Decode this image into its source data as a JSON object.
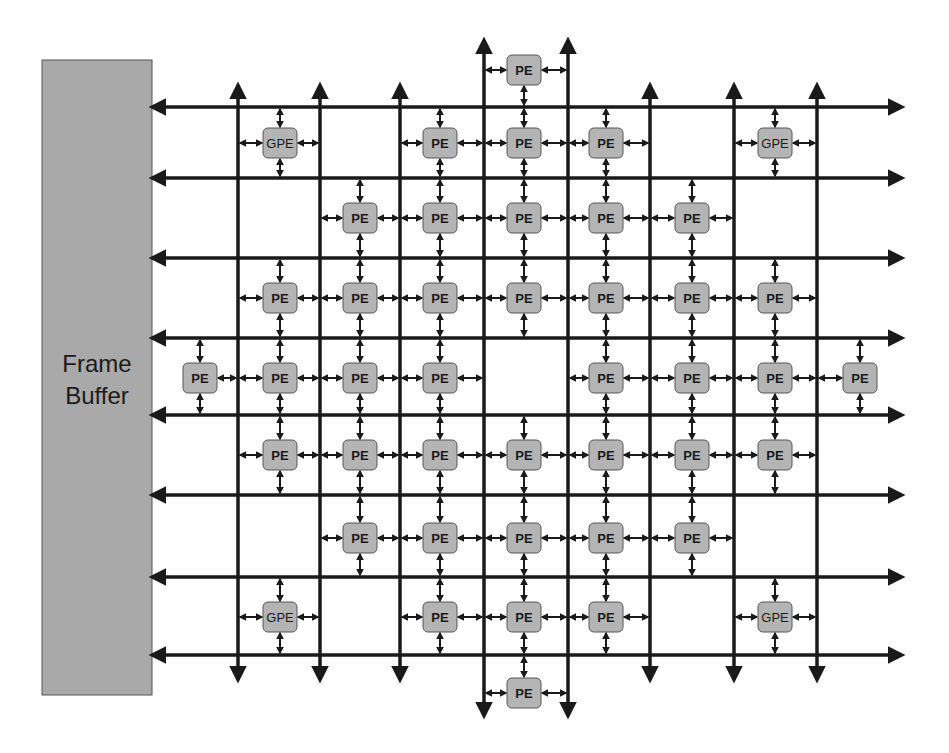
{
  "diagram": {
    "frame_buffer": {
      "label_line1": "Frame",
      "label_line2": "Buffer",
      "x": 42,
      "y": 60,
      "width": 110,
      "height": 635,
      "fill": "#a9a9a9"
    },
    "colors": {
      "line": "#1a1a1a",
      "node_fill": "#b4b4b4",
      "node_stroke": "#555555",
      "background": "#ffffff"
    },
    "horizontal_buses": [
      107,
      178,
      258,
      338,
      415,
      495,
      577,
      655
    ],
    "bus_x_start": 152,
    "bus_x_end": 902,
    "vertical_buses": [
      {
        "x": 238,
        "y1": 85,
        "y2": 680
      },
      {
        "x": 320,
        "y1": 85,
        "y2": 680
      },
      {
        "x": 400,
        "y1": 85,
        "y2": 680
      },
      {
        "x": 484,
        "y1": 40,
        "y2": 716
      },
      {
        "x": 568,
        "y1": 40,
        "y2": 716
      },
      {
        "x": 650,
        "y1": 85,
        "y2": 680
      },
      {
        "x": 734,
        "y1": 85,
        "y2": 680
      },
      {
        "x": 817,
        "y1": 85,
        "y2": 680
      }
    ],
    "nodes": [
      {
        "label": "PE",
        "x": 524,
        "y": 70,
        "up": null,
        "down": 107,
        "left": 484,
        "right": 568
      },
      {
        "label": "GPE",
        "x": 280,
        "y": 143,
        "up": 107,
        "down": 178,
        "left": 238,
        "right": 320
      },
      {
        "label": "PE",
        "x": 440,
        "y": 143,
        "up": 107,
        "down": 178,
        "left": 400,
        "right": 484
      },
      {
        "label": "PE",
        "x": 524,
        "y": 143,
        "up": 107,
        "down": 178,
        "left": 484,
        "right": 568
      },
      {
        "label": "PE",
        "x": 606,
        "y": 143,
        "up": 107,
        "down": 178,
        "left": 568,
        "right": 650
      },
      {
        "label": "GPE",
        "x": 775,
        "y": 143,
        "up": 107,
        "down": 178,
        "left": 734,
        "right": 817
      },
      {
        "label": "PE",
        "x": 360,
        "y": 218,
        "up": 178,
        "down": 258,
        "left": 320,
        "right": 400
      },
      {
        "label": "PE",
        "x": 440,
        "y": 218,
        "up": 178,
        "down": 258,
        "left": 400,
        "right": 484
      },
      {
        "label": "PE",
        "x": 524,
        "y": 218,
        "up": 178,
        "down": 258,
        "left": 484,
        "right": 568
      },
      {
        "label": "PE",
        "x": 606,
        "y": 218,
        "up": 178,
        "down": 258,
        "left": 568,
        "right": 650
      },
      {
        "label": "PE",
        "x": 692,
        "y": 218,
        "up": 178,
        "down": 258,
        "left": 650,
        "right": 734
      },
      {
        "label": "PE",
        "x": 280,
        "y": 298,
        "up": 258,
        "down": 338,
        "left": 238,
        "right": 320
      },
      {
        "label": "PE",
        "x": 360,
        "y": 298,
        "up": 258,
        "down": 338,
        "left": 320,
        "right": 400
      },
      {
        "label": "PE",
        "x": 440,
        "y": 298,
        "up": 258,
        "down": 338,
        "left": 400,
        "right": 484
      },
      {
        "label": "PE",
        "x": 524,
        "y": 298,
        "up": 258,
        "down": 338,
        "left": 484,
        "right": 568
      },
      {
        "label": "PE",
        "x": 606,
        "y": 298,
        "up": 258,
        "down": 338,
        "left": 568,
        "right": 650
      },
      {
        "label": "PE",
        "x": 692,
        "y": 298,
        "up": 258,
        "down": 338,
        "left": 650,
        "right": 734
      },
      {
        "label": "PE",
        "x": 775,
        "y": 298,
        "up": 258,
        "down": 338,
        "left": 734,
        "right": 817
      },
      {
        "label": "PE",
        "x": 200,
        "y": 378,
        "up": 338,
        "down": 415,
        "left": null,
        "right": 238
      },
      {
        "label": "PE",
        "x": 280,
        "y": 378,
        "up": 338,
        "down": 415,
        "left": 238,
        "right": 320
      },
      {
        "label": "PE",
        "x": 360,
        "y": 378,
        "up": 338,
        "down": 415,
        "left": 320,
        "right": 400
      },
      {
        "label": "PE",
        "x": 440,
        "y": 378,
        "up": 338,
        "down": 415,
        "left": 400,
        "right": 484
      },
      {
        "label": "PE",
        "x": 606,
        "y": 378,
        "up": 338,
        "down": 415,
        "left": 568,
        "right": 650
      },
      {
        "label": "PE",
        "x": 692,
        "y": 378,
        "up": 338,
        "down": 415,
        "left": 650,
        "right": 734
      },
      {
        "label": "PE",
        "x": 775,
        "y": 378,
        "up": 338,
        "down": 415,
        "left": 734,
        "right": 817
      },
      {
        "label": "PE",
        "x": 860,
        "y": 378,
        "up": 338,
        "down": 415,
        "left": 817,
        "right": null
      },
      {
        "label": "PE",
        "x": 280,
        "y": 455,
        "up": 415,
        "down": 495,
        "left": 238,
        "right": 320
      },
      {
        "label": "PE",
        "x": 360,
        "y": 455,
        "up": 415,
        "down": 495,
        "left": 320,
        "right": 400
      },
      {
        "label": "PE",
        "x": 440,
        "y": 455,
        "up": 415,
        "down": 495,
        "left": 400,
        "right": 484
      },
      {
        "label": "PE",
        "x": 524,
        "y": 455,
        "up": 415,
        "down": 495,
        "left": 484,
        "right": 568
      },
      {
        "label": "PE",
        "x": 606,
        "y": 455,
        "up": 415,
        "down": 495,
        "left": 568,
        "right": 650
      },
      {
        "label": "PE",
        "x": 692,
        "y": 455,
        "up": 415,
        "down": 495,
        "left": 650,
        "right": 734
      },
      {
        "label": "PE",
        "x": 775,
        "y": 455,
        "up": 415,
        "down": 495,
        "left": 734,
        "right": 817
      },
      {
        "label": "PE",
        "x": 360,
        "y": 538,
        "up": 495,
        "down": 577,
        "left": 320,
        "right": 400
      },
      {
        "label": "PE",
        "x": 440,
        "y": 538,
        "up": 495,
        "down": 577,
        "left": 400,
        "right": 484
      },
      {
        "label": "PE",
        "x": 524,
        "y": 538,
        "up": 495,
        "down": 577,
        "left": 484,
        "right": 568
      },
      {
        "label": "PE",
        "x": 606,
        "y": 538,
        "up": 495,
        "down": 577,
        "left": 568,
        "right": 650
      },
      {
        "label": "PE",
        "x": 692,
        "y": 538,
        "up": 495,
        "down": 577,
        "left": 650,
        "right": 734
      },
      {
        "label": "GPE",
        "x": 280,
        "y": 617,
        "up": 577,
        "down": 655,
        "left": 238,
        "right": 320
      },
      {
        "label": "PE",
        "x": 440,
        "y": 617,
        "up": 577,
        "down": 655,
        "left": 400,
        "right": 484
      },
      {
        "label": "PE",
        "x": 524,
        "y": 617,
        "up": 577,
        "down": 655,
        "left": 484,
        "right": 568
      },
      {
        "label": "PE",
        "x": 606,
        "y": 617,
        "up": 577,
        "down": 655,
        "left": 568,
        "right": 650
      },
      {
        "label": "GPE",
        "x": 775,
        "y": 617,
        "up": 577,
        "down": 655,
        "left": 734,
        "right": 817
      },
      {
        "label": "PE",
        "x": 524,
        "y": 693,
        "up": 655,
        "down": null,
        "left": 484,
        "right": 568
      }
    ]
  }
}
